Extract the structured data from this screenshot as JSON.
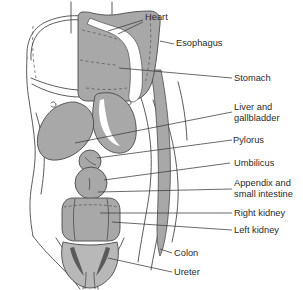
{
  "figure": {
    "colors": {
      "organ_fill": "#a8a8a8",
      "organ_fill_light": "#b8b8b8",
      "organ_stroke": "#4a4a4a",
      "body_outline": "#4a4a4a",
      "leader_line": "#3a3a3a",
      "text": "#2b2b2b",
      "background": "#ffffff"
    },
    "labels": [
      {
        "id": "heart",
        "text": "Heart",
        "x": 145,
        "y": 17,
        "anchor": "start"
      },
      {
        "id": "esophagus",
        "text": "Esophagus",
        "x": 176,
        "y": 46,
        "anchor": "start"
      },
      {
        "id": "stomach",
        "text": "Stomach",
        "x": 234,
        "y": 81,
        "anchor": "start"
      },
      {
        "id": "liver1",
        "text": "Liver and",
        "x": 234,
        "y": 110,
        "anchor": "start"
      },
      {
        "id": "liver2",
        "text": "gallbladder",
        "x": 234,
        "y": 121,
        "anchor": "start"
      },
      {
        "id": "pylorus",
        "text": "Pylorus",
        "x": 233,
        "y": 143,
        "anchor": "start"
      },
      {
        "id": "umbilicus",
        "text": "Umbilicus",
        "x": 234,
        "y": 166,
        "anchor": "start"
      },
      {
        "id": "appendix1",
        "text": "Appendix and",
        "x": 234,
        "y": 186,
        "anchor": "start"
      },
      {
        "id": "appendix2",
        "text": "small intestine",
        "x": 234,
        "y": 197,
        "anchor": "start"
      },
      {
        "id": "rkidney",
        "text": "Right kidney",
        "x": 234,
        "y": 216,
        "anchor": "start"
      },
      {
        "id": "lkidney",
        "text": "Left kidney",
        "x": 234,
        "y": 233,
        "anchor": "start"
      },
      {
        "id": "colon",
        "text": "Colon",
        "x": 174,
        "y": 256,
        "anchor": "start"
      },
      {
        "id": "ureter",
        "text": "Ureter",
        "x": 174,
        "y": 275,
        "anchor": "start"
      }
    ],
    "organs": [
      {
        "id": "heart-lung-cavity",
        "name": "Heart and mediastinal cavity"
      },
      {
        "id": "esophagus-channel",
        "name": "Esophagus"
      },
      {
        "id": "stomach",
        "name": "Stomach"
      },
      {
        "id": "liver-gallbladder",
        "name": "Liver and gallbladder"
      },
      {
        "id": "pylorus",
        "name": "Pylorus"
      },
      {
        "id": "umbilicus",
        "name": "Umbilicus"
      },
      {
        "id": "appendix-small-intestine",
        "name": "Appendix and small intestine"
      },
      {
        "id": "right-kidney",
        "name": "Right kidney"
      },
      {
        "id": "left-kidney",
        "name": "Left kidney"
      },
      {
        "id": "descending-colon",
        "name": "Colon"
      },
      {
        "id": "ureter",
        "name": "Ureter"
      }
    ]
  }
}
